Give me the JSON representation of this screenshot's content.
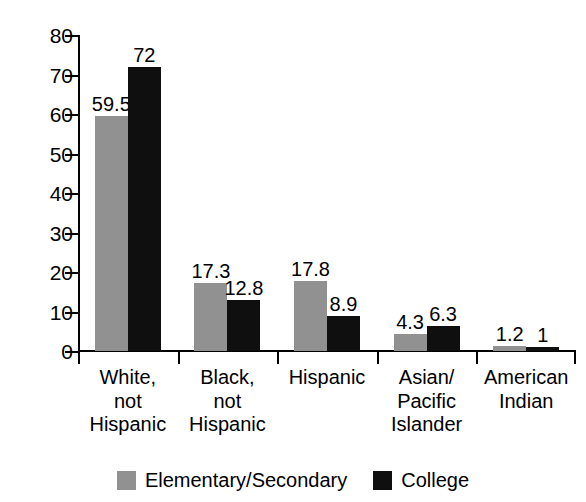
{
  "chart_data": {
    "type": "bar",
    "title": "",
    "subtitle": "",
    "xlabel": "",
    "ylabel": "",
    "grid": false,
    "legend_position": "bottom",
    "ylim": [
      0,
      80
    ],
    "yticks": [
      0,
      10,
      20,
      30,
      40,
      50,
      60,
      70,
      80
    ],
    "ytick_labels": [
      "0",
      "10",
      "20",
      "30",
      "40",
      "50",
      "60",
      "70",
      "80"
    ],
    "categories": [
      "White,\nnot\nHispanic",
      "Black,\nnot\nHispanic",
      "Hispanic",
      "Asian/\nPacific\nIslander",
      "American\nIndian"
    ],
    "series": [
      {
        "name": "Elementary/Secondary",
        "color": "#919191",
        "values": [
          59.5,
          17.3,
          17.8,
          4.3,
          1.2
        ],
        "labels": [
          "59.5",
          "17.3",
          "17.8",
          "4.3",
          "1.2"
        ]
      },
      {
        "name": "College",
        "color": "#0f0f0f",
        "values": [
          72,
          12.8,
          8.9,
          6.3,
          1
        ],
        "labels": [
          "72",
          "12.8",
          "8.9",
          "6.3",
          "1"
        ]
      }
    ]
  },
  "legend": {
    "items": [
      {
        "label": "Elementary/Secondary",
        "swatch": "elementary"
      },
      {
        "label": "College",
        "swatch": "college"
      }
    ]
  },
  "colors": {
    "elementary": "#919191",
    "college": "#0f0f0f",
    "axis": "#000000",
    "background": "#ffffff"
  }
}
